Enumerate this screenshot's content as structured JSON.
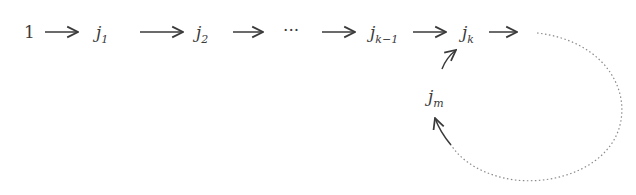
{
  "diagram": {
    "nodes": [
      {
        "id": "n1",
        "base": "1",
        "sub": "",
        "italic": false,
        "x": 24,
        "y": 24
      },
      {
        "id": "j1",
        "base": "j",
        "sub": "1",
        "x": 96,
        "y": 24
      },
      {
        "id": "j2",
        "base": "j",
        "sub": "2",
        "x": 196,
        "y": 24
      },
      {
        "id": "dots",
        "base": "···",
        "sub": "",
        "italic": false,
        "x": 283,
        "y": 22
      },
      {
        "id": "jk-1",
        "base": "j",
        "sub": "k−1",
        "x": 370,
        "y": 24
      },
      {
        "id": "jk",
        "base": "j",
        "sub": "k",
        "x": 462,
        "y": 24
      },
      {
        "id": "jm",
        "base": "j",
        "sub": "m",
        "x": 428,
        "y": 88
      }
    ],
    "edges": [
      {
        "from": "1",
        "to": "j1",
        "style": "solid"
      },
      {
        "from": "j1",
        "to": "j2",
        "style": "solid"
      },
      {
        "from": "j2",
        "to": "dots",
        "style": "solid"
      },
      {
        "from": "dots",
        "to": "jk-1",
        "style": "solid"
      },
      {
        "from": "jk-1",
        "to": "jk",
        "style": "solid"
      },
      {
        "from": "jk",
        "to": "cycle",
        "style": "solid"
      },
      {
        "from": "cycle",
        "to": "jm",
        "style": "dotted"
      },
      {
        "from": "jm",
        "to": "jk",
        "style": "solid"
      }
    ],
    "colors": {
      "ink": "#3a3a3a",
      "dotted": "#8a8a8a"
    }
  }
}
